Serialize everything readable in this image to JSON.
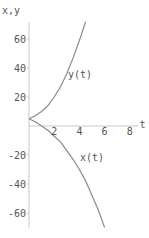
{
  "chart_data": {
    "type": "line",
    "title": "",
    "xlabel": "t",
    "ylabel": "x, y",
    "xlim": [
      0,
      9
    ],
    "ylim": [
      -70,
      70
    ],
    "x_ticks": [
      2,
      4,
      6,
      8
    ],
    "y_ticks": [
      60,
      40,
      20,
      -20,
      -40,
      -60
    ],
    "grid": false,
    "series": [
      {
        "name": "y(t)",
        "label": "y(t)",
        "t": [
          0,
          0.5,
          1,
          1.5,
          2,
          2.5,
          3,
          3.5,
          4,
          4.5
        ],
        "values": [
          5,
          7,
          10,
          14,
          20,
          27,
          36,
          47,
          59,
          72
        ]
      },
      {
        "name": "x(t)",
        "label": "x(t)",
        "t": [
          0,
          0.5,
          1,
          1.5,
          2,
          2.5,
          3,
          3.5,
          4,
          4.5,
          5,
          5.5,
          6
        ],
        "values": [
          5,
          3,
          0,
          -3,
          -7,
          -11,
          -17,
          -23,
          -30,
          -38,
          -48,
          -58,
          -70
        ]
      }
    ],
    "colors": {
      "curve": "#8a8a8a",
      "axis": "#c8c8c8",
      "text": "#555555"
    }
  }
}
